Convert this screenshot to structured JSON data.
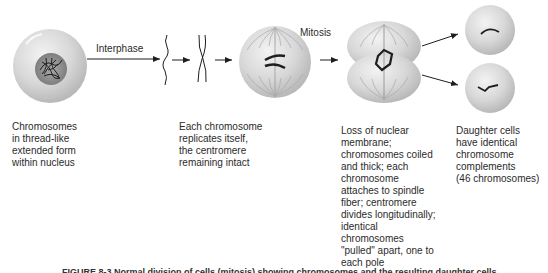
{
  "diagram": {
    "steps": [
      {
        "id": "stage-1",
        "label": ""
      },
      {
        "id": "interphase",
        "label": "Interphase"
      },
      {
        "id": "mitosis",
        "label": "Mitosis"
      }
    ],
    "descriptions": [
      "Chromosomes\nin thread-like\nextended form\nwithin nucleus",
      "Each chromosome\nreplicates itself,\nthe centromere\nremaining intact",
      "Loss of nuclear\nmembrane;\nchromosomes coiled\nand thick; each\nchromosome\nattaches to spindle\nfiber; centromere\ndivides longitudinally;\nidentical\nchromosomes\n\"pulled\" apart, one to\neach pole",
      "Daughter cells\nhave identical\nchromosome\ncomplements\n(46 chromosomes)"
    ],
    "caption": "FIGURE 8-3  Normal division of cells (mitosis) showing chromosomes and the resulting daughter cells"
  },
  "colors": {
    "cell_fill": "#d9d9d9",
    "nucleus_fill": "#8e8e8e",
    "chromosome": "#1e1e1e",
    "arrow": "#1e1e1e"
  }
}
